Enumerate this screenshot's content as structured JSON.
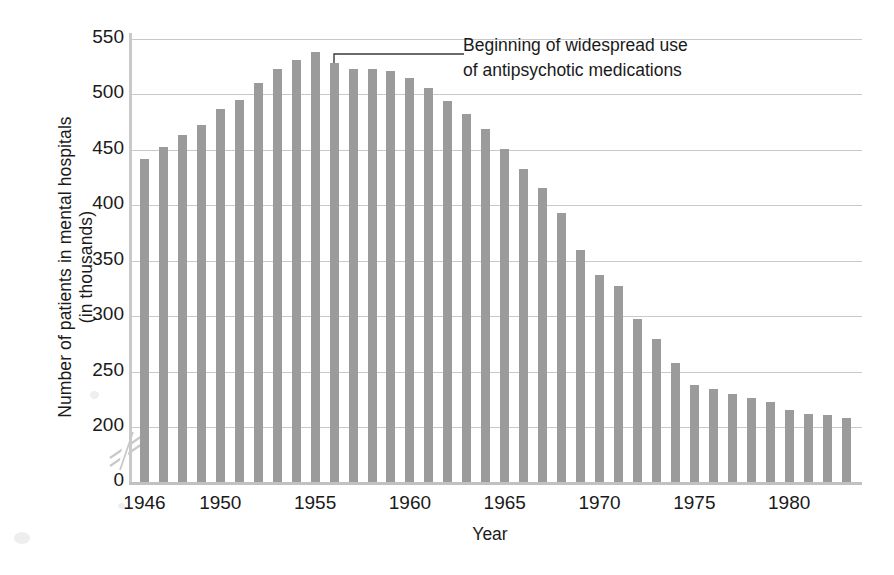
{
  "chart_data": {
    "type": "bar",
    "title": "",
    "xlabel": "Year",
    "ylabel": "Number of patients in mental hospitals\n(in thousands)",
    "ylim": [
      0,
      550
    ],
    "y_break": {
      "from": 0,
      "to": 200,
      "note": "axis break between 0 and 200"
    },
    "grid": true,
    "legend": "none",
    "ytick_labels": [
      "550",
      "500",
      "450",
      "400",
      "350",
      "300",
      "250",
      "200",
      "0"
    ],
    "ytick_values": [
      550,
      500,
      450,
      400,
      350,
      300,
      250,
      200,
      0
    ],
    "xtick_labels": [
      "1946",
      "1950",
      "1955",
      "1960",
      "1965",
      "1970",
      "1975",
      "1980"
    ],
    "xtick_values": [
      1946,
      1950,
      1955,
      1960,
      1965,
      1970,
      1975,
      1980
    ],
    "categories": [
      "1946",
      "1947",
      "1948",
      "1949",
      "1950",
      "1951",
      "1952",
      "1953",
      "1954",
      "1955",
      "1956",
      "1957",
      "1958",
      "1959",
      "1960",
      "1961",
      "1962",
      "1963",
      "1964",
      "1965",
      "1966",
      "1967",
      "1968",
      "1969",
      "1970",
      "1971",
      "1972",
      "1973",
      "1974",
      "1975",
      "1976",
      "1977",
      "1978",
      "1979",
      "1980",
      "1981",
      "1982",
      "1983"
    ],
    "values": [
      442,
      453,
      463,
      472,
      487,
      495,
      510,
      523,
      531,
      538,
      528,
      523,
      523,
      521,
      515,
      506,
      494,
      482,
      469,
      451,
      433,
      416,
      393,
      360,
      337,
      327,
      297,
      279,
      258,
      238,
      234,
      230,
      226,
      223,
      215,
      212,
      211,
      208
    ],
    "bar_color": "#9b9b9b",
    "gridline_color": "#c9c9c9",
    "annotations": [
      {
        "text": "Beginning of widespread use\nof antipsychotic medications",
        "points_to_category": "1956",
        "points_to_value": 528
      }
    ]
  },
  "annotation": {
    "line1": "Beginning of widespread use",
    "line2": "of antipsychotic medications",
    "full": "Beginning of widespread use\nof antipsychotic medications"
  },
  "axis": {
    "y_title": "Number of patients in mental hospitals\n(in thousands)",
    "x_title": "Year"
  }
}
